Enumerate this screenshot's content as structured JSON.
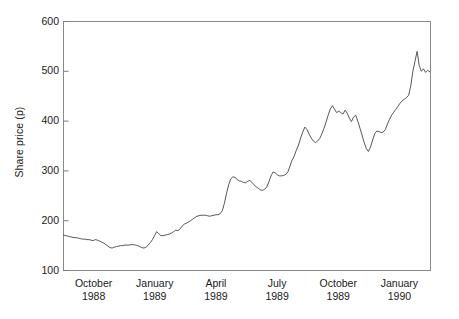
{
  "chart_data": {
    "type": "line",
    "title": "",
    "subtitle": "",
    "xlabel": "",
    "ylabel": "Share price (p)",
    "ylim": [
      100,
      600
    ],
    "yticks": [
      100,
      200,
      300,
      400,
      500,
      600
    ],
    "ytick_labels": [
      "100",
      "200",
      "300",
      "400",
      "500",
      "600"
    ],
    "grid": false,
    "legend": null,
    "line_color": "#444444",
    "background_color": "#ffffff",
    "axis_color": "#7a7a7a",
    "xtick_labels": [
      {
        "month": "October",
        "year": "1988"
      },
      {
        "month": "January",
        "year": "1989"
      },
      {
        "month": "April",
        "year": "1989"
      },
      {
        "month": "July",
        "year": "1989"
      },
      {
        "month": "October",
        "year": "1989"
      },
      {
        "month": "January",
        "year": "1990"
      }
    ],
    "x_range_start": "October 1988",
    "x_range_end": "January 1990",
    "x": [
      0.0,
      0.6,
      1.2,
      1.8,
      2.4,
      3.0,
      3.6,
      4.2,
      4.8,
      5.4,
      6.0,
      6.6,
      7.2,
      7.8,
      8.4,
      9.0,
      9.6,
      10.2,
      10.8,
      11.4,
      12.0,
      12.6,
      13.2,
      13.8,
      14.4,
      15.0,
      15.6,
      16.2,
      16.8,
      17.4,
      18.0,
      18.6,
      19.2,
      19.8,
      20.4,
      21.0,
      21.6,
      22.2,
      22.8,
      23.4,
      24.0,
      24.6,
      25.2,
      25.8,
      26.4,
      27.0,
      27.6,
      28.2,
      28.8,
      29.4,
      30.0,
      30.6,
      31.2,
      31.8,
      32.4,
      33.0,
      33.6,
      34.2,
      34.8,
      35.4,
      36.0,
      36.6,
      37.2,
      37.8,
      38.4,
      39.0,
      39.6,
      40.2,
      40.8,
      41.4,
      42.0,
      42.6,
      43.2,
      43.8,
      44.4,
      45.0,
      45.6,
      46.2,
      46.8,
      47.4,
      48.0,
      48.6,
      49.2,
      49.8,
      50.4,
      51.0,
      51.6,
      52.2,
      52.8,
      53.4,
      54.0,
      54.6,
      55.2,
      55.8,
      56.4,
      57.0,
      57.6,
      58.2,
      58.8,
      59.4,
      60.0,
      60.6,
      61.2,
      61.8,
      62.4,
      63.0,
      63.6,
      64.2,
      64.8,
      65.4,
      66.0,
      66.6,
      67.2,
      67.8,
      68.4,
      69.0,
      69.6,
      70.2,
      70.8,
      71.4,
      72.0,
      72.6,
      73.2,
      73.8,
      74.4,
      75.0,
      75.6,
      76.2,
      76.8,
      77.4,
      78.0,
      78.6,
      79.2,
      79.8,
      80.4,
      81.0,
      81.6,
      82.2,
      82.8,
      83.4,
      84.0,
      84.6,
      85.2,
      85.8,
      86.4,
      87.0,
      87.6,
      88.2,
      88.8,
      89.4,
      90.0,
      90.6,
      91.2,
      91.8,
      92.4,
      93.0,
      93.6,
      94.2,
      94.8,
      95.4,
      96.0,
      96.6,
      97.2,
      97.8,
      98.4,
      99.0,
      99.6,
      100.2
    ],
    "values": [
      171,
      170,
      169,
      168,
      167,
      166,
      166,
      165,
      164,
      163,
      163,
      162,
      162,
      161,
      160,
      162,
      161,
      159,
      157,
      155,
      152,
      149,
      146,
      145,
      147,
      148,
      149,
      150,
      150,
      151,
      151,
      151,
      152,
      152,
      151,
      150,
      148,
      146,
      145,
      147,
      151,
      156,
      162,
      170,
      178,
      174,
      170,
      170,
      171,
      172,
      173,
      175,
      178,
      181,
      180,
      183,
      189,
      193,
      195,
      197,
      200,
      203,
      206,
      209,
      210,
      211,
      211,
      211,
      210,
      209,
      210,
      211,
      212,
      212,
      214,
      220,
      235,
      255,
      272,
      284,
      288,
      287,
      283,
      280,
      279,
      277,
      276,
      279,
      281,
      277,
      272,
      268,
      265,
      262,
      261,
      263,
      268,
      278,
      290,
      298,
      296,
      292,
      290,
      290,
      291,
      293,
      298,
      310,
      322,
      330,
      342,
      352,
      366,
      378,
      388,
      383,
      374,
      366,
      360,
      357,
      360,
      365,
      374,
      385,
      398,
      412,
      424,
      431,
      424,
      417,
      420,
      417,
      414,
      422,
      416,
      406,
      399,
      408,
      412,
      400,
      386,
      372,
      357,
      345,
      339,
      348,
      362,
      375,
      380,
      379,
      377,
      378,
      383,
      394,
      404,
      412,
      418,
      424,
      430,
      436,
      441,
      444,
      447,
      452,
      470,
      500,
      520,
      540
    ],
    "tail_values": [
      {
        "v": 512
      },
      {
        "v": 500
      },
      {
        "v": 505
      },
      {
        "v": 498
      },
      {
        "v": 502
      },
      {
        "v": 499
      }
    ],
    "y_min_observed": 145,
    "y_max_observed": 540,
    "y_first": 171,
    "y_last": 499
  }
}
